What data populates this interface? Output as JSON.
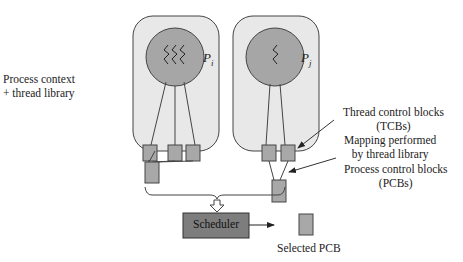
{
  "diagram": {
    "left_label": [
      "Process context",
      "+ thread library"
    ],
    "processes": [
      {
        "name": "P",
        "subscript": "i",
        "tcb_count": 3
      },
      {
        "name": "P",
        "subscript": "j",
        "tcb_count": 2
      }
    ],
    "ellipsis": "...",
    "annotations": {
      "tcb": [
        "Thread control blocks",
        "(TCBs)"
      ],
      "mapping": [
        "Mapping performed",
        "by thread library"
      ],
      "pcb": [
        "Process control blocks",
        "(PCBs)"
      ]
    },
    "scheduler_label": "Scheduler",
    "selected_pcb_label": "Selected PCB",
    "colors": {
      "process_box_fill": "#e8e8e8",
      "circle_fill": "#a6a6a6",
      "block_fill": "#a8a8a8",
      "scheduler_fill": "#7d7d7d",
      "stroke": "#333333"
    }
  }
}
